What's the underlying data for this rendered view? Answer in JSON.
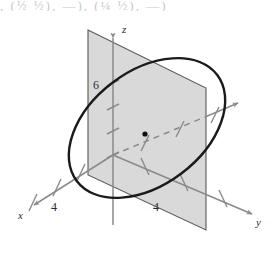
{
  "figure": {
    "clipped_text_above": ", (½    ½),        —),      (¼    ½),      —)",
    "background_color": "#ffffff",
    "plane_fill_color": "#d8d8d8",
    "plane_edge_color": "#5a5a5a",
    "curve_color": "#1a1a1a",
    "axis_color": "#8a8a8a",
    "label_color": "#2b2b2b",
    "axes": [
      {
        "name": "z-axis",
        "label": "z",
        "direction": "up",
        "label_x": 122,
        "label_y": 30
      },
      {
        "name": "x-axis",
        "label": "x",
        "direction": "down-left",
        "label_x": 20,
        "label_y": 216
      },
      {
        "name": "y-axis",
        "label": "y",
        "direction": "down-right",
        "label_x": 258,
        "label_y": 222
      }
    ],
    "tick_labels": [
      {
        "name": "z-tick-6",
        "text": "6",
        "x": 96,
        "y": 87,
        "axis": "z"
      },
      {
        "name": "x-tick-4",
        "text": "4",
        "x": 54,
        "y": 208,
        "axis": "x"
      },
      {
        "name": "y-tick-4",
        "text": "4",
        "x": 157,
        "y": 208,
        "axis": "y"
      }
    ],
    "center_point": {
      "name": "center-dot",
      "x": 145,
      "y": 134,
      "radius": 2.6
    },
    "dashed_segment": {
      "name": "dashed-axis-segment",
      "from_x": 113,
      "to_x": 205,
      "label": "hidden y-axis"
    },
    "ellipse": {
      "name": "circle-on-plane",
      "center_x": 147,
      "center_y": 128,
      "rx": 88,
      "ry": 57,
      "rotation_deg": -37,
      "stroke_width": 2.4
    },
    "plane": {
      "name": "tilted-plane",
      "corners": [
        {
          "x": 88,
          "y": 30
        },
        {
          "x": 206,
          "y": 88
        },
        {
          "x": 206,
          "y": 230
        },
        {
          "x": 88,
          "y": 175
        }
      ]
    }
  }
}
